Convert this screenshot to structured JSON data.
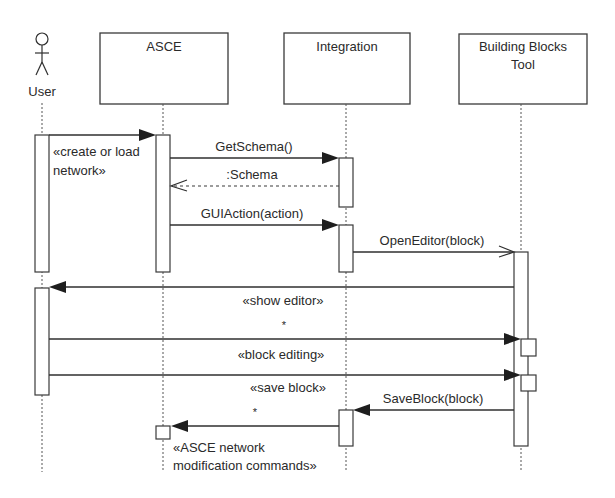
{
  "diagram": {
    "type": "UML sequence diagram",
    "participants": [
      {
        "id": "user",
        "label": "User",
        "kind": "actor"
      },
      {
        "id": "asce",
        "label": "ASCE",
        "kind": "object"
      },
      {
        "id": "integration",
        "label": "Integration",
        "kind": "object"
      },
      {
        "id": "bbt",
        "label_line1": "Building Blocks",
        "label_line2": "Tool",
        "kind": "object"
      }
    ],
    "messages": [
      {
        "from": "user",
        "to": "asce",
        "label_line1": "«create or load",
        "label_line2": "network»",
        "style": "sync"
      },
      {
        "from": "asce",
        "to": "integration",
        "label": "GetSchema()",
        "style": "sync"
      },
      {
        "from": "integration",
        "to": "asce",
        "label": ":Schema",
        "style": "return"
      },
      {
        "from": "asce",
        "to": "integration",
        "label": "GUIAction(action)",
        "style": "sync"
      },
      {
        "from": "integration",
        "to": "bbt",
        "label": "OpenEditor(block)",
        "style": "async"
      },
      {
        "from": "bbt",
        "to": "user",
        "label": "«show editor»",
        "style": "sync"
      },
      {
        "from": "user",
        "to": "bbt",
        "label": "«block editing»",
        "multiplicity": "*",
        "style": "sync"
      },
      {
        "from": "user",
        "to": "bbt",
        "label": "«save block»",
        "style": "sync"
      },
      {
        "from": "bbt",
        "to": "integration",
        "label": "SaveBlock(block)",
        "style": "sync"
      },
      {
        "from": "integration",
        "to": "asce",
        "label_line1": "«ASCE network",
        "label_line2": "modification commands»",
        "multiplicity": "*",
        "style": "sync"
      }
    ],
    "multiplicity_marks": [
      "*",
      "*"
    ]
  }
}
